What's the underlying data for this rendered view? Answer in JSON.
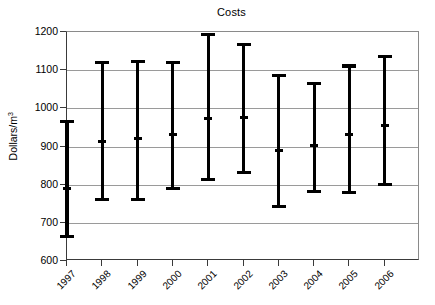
{
  "chart_data": {
    "type": "bar",
    "subtype": "error-bar-range",
    "title": "Costs",
    "xlabel": "",
    "ylabel": "Dollars/m3",
    "ylabel_display": "Dollars/m",
    "ylabel_superscript": "3",
    "categories": [
      "1997",
      "1998",
      "1999",
      "2000",
      "2001",
      "2002",
      "2003",
      "2004",
      "2005",
      "2006"
    ],
    "ylim": [
      600,
      1200
    ],
    "yticks": [
      600,
      700,
      800,
      900,
      1000,
      1100,
      1200
    ],
    "ytick_labels": [
      "600",
      "700",
      "800",
      "900",
      "1000",
      "1100",
      "1200"
    ],
    "grid": true,
    "grid_axis": "y",
    "legend": "none",
    "series": [
      {
        "name": "high",
        "values": [
          966,
          1119,
          1122,
          1120,
          1193,
          1167,
          1086,
          1064,
          1111,
          1135
        ]
      },
      {
        "name": "mid",
        "values": [
          790,
          913,
          922,
          932,
          974,
          975,
          890,
          902,
          932,
          955
        ]
      },
      {
        "name": "low",
        "values": [
          664,
          760,
          760,
          790,
          814,
          831,
          742,
          781,
          779,
          800
        ]
      }
    ],
    "points": [
      {
        "category": "1997",
        "low": 664,
        "mid": 790,
        "high": 966
      },
      {
        "category": "1998",
        "low": 760,
        "mid": 913,
        "high": 1119
      },
      {
        "category": "1999",
        "low": 760,
        "mid": 922,
        "high": 1122
      },
      {
        "category": "2000",
        "low": 790,
        "mid": 932,
        "high": 1120
      },
      {
        "category": "2001",
        "low": 814,
        "mid": 974,
        "high": 1193
      },
      {
        "category": "2002",
        "low": 831,
        "mid": 975,
        "high": 1167
      },
      {
        "category": "2003",
        "low": 742,
        "mid": 890,
        "high": 1086
      },
      {
        "category": "2004",
        "low": 781,
        "mid": 902,
        "high": 1064
      },
      {
        "category": "2005",
        "low": 779,
        "mid": 932,
        "high": 1111
      },
      {
        "category": "2006",
        "low": 800,
        "mid": 955,
        "high": 1135
      }
    ],
    "colors": {
      "bar": "#000000",
      "grid": "#9a9a9a",
      "axis": "#3a3a3a",
      "background": "#ffffff",
      "text": "#000000"
    }
  }
}
